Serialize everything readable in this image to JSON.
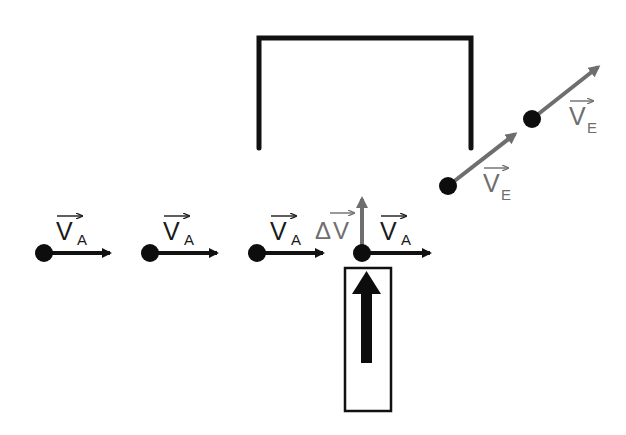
{
  "diagram": {
    "colors": {
      "dark": "#111111",
      "gray": "#6e6e6e",
      "background": "#ffffff"
    },
    "initial_velocity": {
      "symbol": "V",
      "subscript": "A",
      "label": "V_A",
      "count": 4
    },
    "final_velocity": {
      "symbol": "V",
      "subscript": "E",
      "label": "V_E",
      "count": 2
    },
    "delta_velocity": {
      "symbol": "ΔV",
      "prefix": "Δ",
      "letter": "V",
      "label": "ΔV"
    },
    "positions_initial": [
      {
        "x": 44,
        "y": 253
      },
      {
        "x": 150,
        "y": 253
      },
      {
        "x": 257,
        "y": 253
      },
      {
        "x": 362,
        "y": 253
      }
    ],
    "positions_final": [
      {
        "x": 448,
        "y": 186
      },
      {
        "x": 532,
        "y": 119
      }
    ],
    "kick": {
      "label": "impulse (upward force)",
      "box": {
        "x": 345,
        "y": 268,
        "w": 46,
        "h": 143
      }
    },
    "bracket": {
      "left_x": 259,
      "right_x": 471,
      "top_y": 38,
      "bottom_y": 148
    }
  }
}
